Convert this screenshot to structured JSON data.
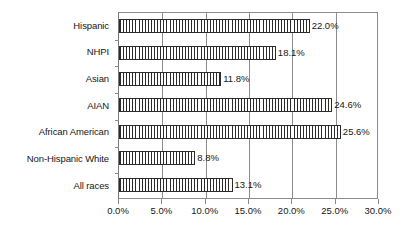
{
  "chart_data": {
    "type": "bar",
    "orientation": "horizontal",
    "title": "",
    "subtitle": "",
    "xlabel": "",
    "ylabel": "",
    "xlim": [
      0,
      30
    ],
    "xtick_labels": [
      "0.0%",
      "5.0%",
      "10.0%",
      "15.0%",
      "20.0%",
      "25.0%",
      "30.0%"
    ],
    "xtick_values": [
      0,
      5,
      10,
      15,
      20,
      25,
      30
    ],
    "grid": true,
    "legend": false,
    "legend_position": "none",
    "categories": [
      "Hispanic",
      "NHPI",
      "Asian",
      "AIAN",
      "African American",
      "Non-Hispanic White",
      "All races"
    ],
    "values": [
      22.0,
      18.1,
      11.8,
      24.6,
      25.6,
      8.8,
      13.1
    ],
    "value_labels": [
      "22.0%",
      "18.1%",
      "11.8%",
      "24.6%",
      "25.6%",
      "8.8%",
      "13.1%"
    ],
    "bar_fill": "vertical-hatch",
    "bar_border_color": "#2b2b2b",
    "bar_fill_color": "#ffffff",
    "grid_color": "#8c8c8c",
    "text_color": "#161616"
  }
}
